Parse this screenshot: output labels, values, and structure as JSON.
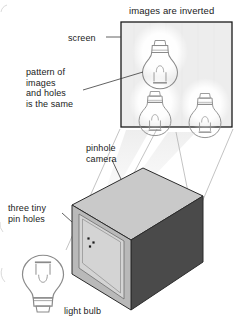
{
  "diagram": {
    "title": "images are inverted",
    "labels": {
      "screen": "screen",
      "pattern": "pattern of\nimages\nand holes\nis the same",
      "pinhole_camera": "pinhole\ncamera",
      "three_tiny_pin_holes": "three tiny\npin holes",
      "light_bulb": "light bulb"
    },
    "colors": {
      "ink": "#1a1a1a",
      "screen_fill": "#ededed",
      "screen_border": "#1a1a1a",
      "box_top": "#c9c9c9",
      "box_front": "#4a4a4a",
      "box_left": "#b5b5b5",
      "box_panel": "#d6d6d6",
      "glow": "#ffffff",
      "ray": "#a8a8a8",
      "beam": "#e8e8e8",
      "bulb_outline": "#8a8a8a",
      "pinhole": "#222222"
    },
    "screen": {
      "x": 121,
      "y": 22,
      "width": 111,
      "height": 105,
      "images": [
        {
          "name": "inverted-bulb-image-top",
          "cx": 160,
          "cy": 52,
          "scale": 1.0,
          "inverted": true
        },
        {
          "name": "inverted-bulb-image-bottom-left",
          "cx": 155,
          "cy": 102,
          "scale": 0.92,
          "inverted": true
        },
        {
          "name": "inverted-bulb-image-bottom-right",
          "cx": 205,
          "cy": 104,
          "scale": 0.92,
          "inverted": true
        }
      ]
    },
    "camera_box": {
      "top_face": "top",
      "front_face": "front-right",
      "left_face": "left",
      "pin_holes_count": 3,
      "pin_holes": [
        {
          "cx": 88.5,
          "cy": 238.5
        },
        {
          "cx": 93.5,
          "cy": 242.5
        },
        {
          "cx": 90.0,
          "cy": 246.5
        }
      ]
    },
    "light_bulb": {
      "cx": 43,
      "cy": 288,
      "inverted": false
    }
  }
}
